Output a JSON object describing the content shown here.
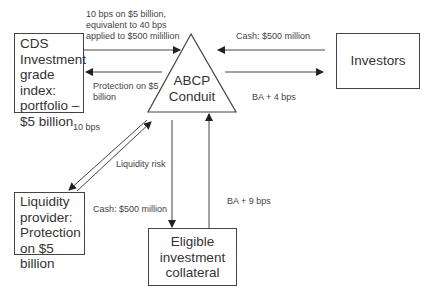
{
  "nodes": {
    "cds": {
      "line1": "CDS",
      "line2": "Investment",
      "line3": "grade index:",
      "line4": "portfolio –",
      "line5": "$5 billion"
    },
    "conduit": {
      "line1": "ABCP",
      "line2": "Conduit"
    },
    "investors": {
      "label": "Investors"
    },
    "liquidity": {
      "line1": "Liquidity",
      "line2": "provider:",
      "line3": "Protection",
      "line4": "on $5 billion"
    },
    "collateral": {
      "line1": "Eligible",
      "line2": "investment",
      "line3": "collateral"
    }
  },
  "edges": {
    "cds_premium": {
      "line1": "10 bps on $5 billion,",
      "line2": "equivalent to 40 bps",
      "line3": "applied to $500 milillion"
    },
    "protection": {
      "line1": "Protection on $5",
      "line2": "billion"
    },
    "investor_cash": "Cash: $500 million",
    "investor_return": "BA + 4 bps",
    "liquidity_fee": "10 bps",
    "liquidity_risk": "Liquidity risk",
    "collateral_cash": "Cash: $500 million",
    "collateral_return": "BA + 9 bps"
  }
}
